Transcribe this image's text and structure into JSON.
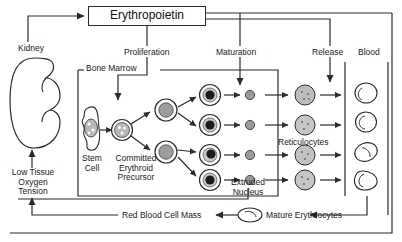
{
  "diagram": {
    "title": "Erythropoietin",
    "type": "erythropoiesis-flow-diagram",
    "colors": {
      "line": "#2b2b2b",
      "cell_fill": "#b9b9b9",
      "nucleus_fill": "#8d8d8d",
      "dark_nucleus": "#1c1c1c",
      "background": "#ffffff"
    },
    "boxes": {
      "erythropoietin": "Erythropoietin",
      "bone_marrow": "Bone Marrow"
    },
    "labels": {
      "kidney": "Kidney",
      "low_tissue_oxygen_tension": "Low Tissue\nOxygen\nTension",
      "proliferation": "Proliferation",
      "maturation": "Maturation",
      "release": "Release",
      "blood": "Blood",
      "stem_cell": "Stem\nCell",
      "committed_erythroid_precursor": "Committed\nErythroid\nPrecursor",
      "extruded_nucleus": "Extruded\nNucleus",
      "reticulocytes": "Reticulocytes",
      "mature_erythrocytes": "Mature Erythrocytes",
      "red_blood_cell_mass": "Red Blood Cell Mass"
    },
    "label_lines": {
      "low_tissue_oxygen_tension": [
        "Low Tissue",
        "Oxygen",
        "Tension"
      ],
      "stem_cell": [
        "Stem",
        "Cell"
      ],
      "committed_erythroid_precursor": [
        "Committed",
        "Erythroid",
        "Precursor"
      ],
      "extruded_nucleus": [
        "Extruded",
        "Nucleus"
      ]
    },
    "counts": {
      "stem_cells": 1,
      "committed_precursors": 1,
      "intermediate_precursors": 2,
      "nucleated_erythroblasts": 4,
      "extruded_nuclei": 4,
      "reticulocytes": 4,
      "blood_erythrocytes": 4
    }
  }
}
